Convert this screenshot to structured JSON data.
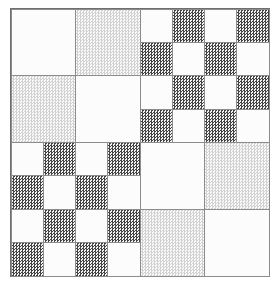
{
  "figure": {
    "width": 278,
    "height": 289,
    "background_color": "#ffffff",
    "frame": {
      "border_color": "#6f6f6f",
      "border_width": 1,
      "x": 10,
      "y": 8,
      "width": 260,
      "height": 269
    },
    "cell_border_color": "#8c8c8c",
    "fills": {
      "white": "#fcfcfc",
      "light": "#d2d2d2",
      "dark": "#444444"
    }
  },
  "chart_data": {
    "type": "heatmap",
    "xlabel": "",
    "ylabel": "",
    "legend": [
      {
        "key": "white",
        "label": "white",
        "color": "#fcfcfc"
      },
      {
        "key": "light",
        "label": "light stipple",
        "color": "#d2d2d2"
      },
      {
        "key": "dark",
        "label": "dark stipple",
        "color": "#444444"
      }
    ],
    "layout": {
      "quadrants": 4,
      "grid": "2x2 of quadrants",
      "grid_lines": true,
      "legend_position": "none"
    },
    "quadrants": [
      {
        "name": "top-left",
        "position": "top-left",
        "divisions": 2,
        "palette": [
          "white",
          "light"
        ],
        "cells": [
          [
            "white",
            "light"
          ],
          [
            "light",
            "white"
          ]
        ]
      },
      {
        "name": "top-right",
        "position": "top-right",
        "divisions": 4,
        "palette": [
          "white",
          "dark"
        ],
        "cells": [
          [
            "white",
            "dark",
            "white",
            "dark"
          ],
          [
            "dark",
            "white",
            "dark",
            "white"
          ],
          [
            "white",
            "dark",
            "white",
            "dark"
          ],
          [
            "dark",
            "white",
            "dark",
            "white"
          ]
        ]
      },
      {
        "name": "bottom-left",
        "position": "bottom-left",
        "divisions": 4,
        "palette": [
          "white",
          "dark"
        ],
        "cells": [
          [
            "white",
            "dark",
            "white",
            "dark"
          ],
          [
            "dark",
            "white",
            "dark",
            "white"
          ],
          [
            "white",
            "dark",
            "white",
            "dark"
          ],
          [
            "dark",
            "white",
            "dark",
            "white"
          ]
        ]
      },
      {
        "name": "bottom-right",
        "position": "bottom-right",
        "divisions": 2,
        "palette": [
          "white",
          "light"
        ],
        "cells": [
          [
            "white",
            "light"
          ],
          [
            "light",
            "white"
          ]
        ]
      }
    ]
  }
}
